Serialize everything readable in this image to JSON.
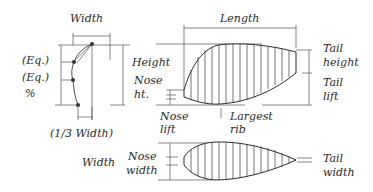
{
  "labels": {
    "width_top": "Width",
    "eq1": "(Eq.)",
    "eq2": "(Eq.)",
    "percent": "%",
    "third_width": "(1/3 Width)",
    "length": "Length",
    "height": "Height",
    "nose_ht_1": "Nose",
    "nose_ht_2": "ht.",
    "nose_lift_1": "Nose",
    "nose_lift_2": "lift",
    "largest_rib_1": "Largest",
    "largest_rib_2": "rib",
    "tail_height_1": "Tail",
    "tail_height_2": "height",
    "tail_lift_1": "Tail",
    "tail_lift_2": "lift",
    "width_bottom": "Width",
    "nose_width_1": "Nose",
    "nose_width_2": "width",
    "tail_width_1": "Tail",
    "tail_width_2": "width"
  },
  "colors": {
    "line": "#3a3a3a",
    "text": "#2a2a2a",
    "background": "#ffffff"
  }
}
